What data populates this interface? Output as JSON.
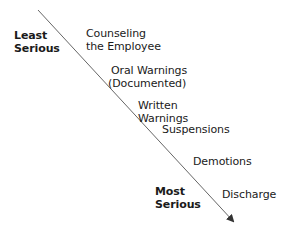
{
  "diagram": {
    "type": "severity-continuum",
    "arrow": {
      "start": [
        38,
        10
      ],
      "end": [
        234,
        222
      ],
      "color": "#555555"
    },
    "ends": {
      "top": {
        "line1": "Least",
        "line2": "Serious"
      },
      "bottom": {
        "line1": "Most",
        "line2": "Serious"
      }
    },
    "steps": [
      {
        "line1": "Counseling",
        "line2": "the Employee"
      },
      {
        "line1": "Oral Warnings",
        "line2": "(Documented)"
      },
      {
        "line1": "Written",
        "line2": "Warnings"
      },
      {
        "line1": "Suspensions",
        "line2": ""
      },
      {
        "line1": "Demotions",
        "line2": ""
      },
      {
        "line1": "Discharge",
        "line2": ""
      }
    ]
  }
}
